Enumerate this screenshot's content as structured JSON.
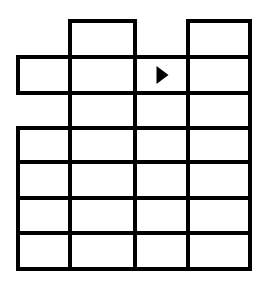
{
  "diagram": {
    "type": "grid-puzzle",
    "columns": 4,
    "rows": 7,
    "colors": {
      "line": "#000000",
      "background": "#ffffff",
      "arrow": "#000000"
    },
    "column_edges_px": [
      18,
      70,
      135,
      188,
      250
    ],
    "row_edges_px": [
      21,
      57,
      93,
      128,
      162,
      198,
      233,
      269
    ],
    "cells_present": [
      [
        false,
        true,
        false,
        true
      ],
      [
        true,
        true,
        true,
        true
      ],
      [
        false,
        true,
        true,
        true
      ],
      [
        true,
        true,
        true,
        true
      ],
      [
        true,
        true,
        true,
        true
      ],
      [
        true,
        true,
        true,
        true
      ],
      [
        true,
        true,
        true,
        true
      ]
    ],
    "marker": {
      "icon": "arrow-right-icon",
      "row": 1,
      "col": 2,
      "glyph": "▶"
    }
  }
}
